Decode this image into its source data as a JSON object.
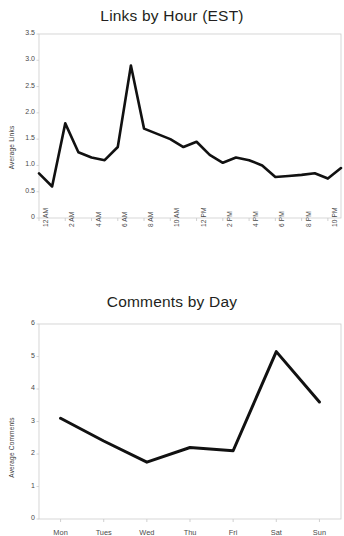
{
  "page": {
    "background_color": "#ffffff",
    "line_color": "#111111",
    "axis_color": "#cccccc",
    "text_color": "#231f20"
  },
  "charts": [
    {
      "id": "links-by-hour",
      "title": "Links by Hour (EST)",
      "ylabel": "Average Links",
      "ytick_labels": [
        "0",
        "0.5",
        "1.0",
        "1.5",
        "2.0",
        "2.5",
        "3.0",
        "3.5"
      ],
      "xtick_labels": [
        "12 AM",
        "2 AM",
        "4 AM",
        "6 AM",
        "8 AM",
        "10 AM",
        "12 PM",
        "2 PM",
        "4 PM",
        "6 PM",
        "8 PM",
        "10 PM"
      ]
    },
    {
      "id": "comments-by-day",
      "title": "Comments by Day",
      "ylabel": "Average Comments",
      "ytick_labels": [
        "0",
        "1",
        "2",
        "3",
        "4",
        "5",
        "6"
      ],
      "xtick_labels": [
        "Mon",
        "Tues",
        "Wed",
        "Thu",
        "Fri",
        "Sat",
        "Sun"
      ]
    }
  ],
  "chart_data": [
    {
      "type": "line",
      "title": "Links by Hour (EST)",
      "xlabel": "",
      "ylabel": "Average Links",
      "ylim": [
        0,
        3.5
      ],
      "ytick_values": [
        0,
        0.5,
        1.0,
        1.5,
        2.0,
        2.5,
        3.0,
        3.5
      ],
      "grid": false,
      "legend": "none",
      "categories": [
        "12 AM",
        "1 AM",
        "2 AM",
        "3 AM",
        "4 AM",
        "5 AM",
        "6 AM",
        "7 AM",
        "8 AM",
        "9 AM",
        "10 AM",
        "11 AM",
        "12 PM",
        "1 PM",
        "2 PM",
        "3 PM",
        "4 PM",
        "5 PM",
        "6 PM",
        "7 PM",
        "8 PM",
        "9 PM",
        "10 PM",
        "11 PM"
      ],
      "xtick_labels": [
        "12 AM",
        "2 AM",
        "4 AM",
        "6 AM",
        "8 AM",
        "10 AM",
        "12 PM",
        "2 PM",
        "4 PM",
        "6 PM",
        "8 PM",
        "10 PM"
      ],
      "values": [
        0.85,
        0.6,
        1.8,
        1.25,
        1.15,
        1.1,
        1.35,
        2.9,
        1.7,
        1.6,
        1.5,
        1.35,
        1.45,
        1.2,
        1.05,
        1.15,
        1.1,
        1.0,
        0.78,
        0.8,
        0.82,
        0.85,
        0.75,
        0.95
      ]
    },
    {
      "type": "line",
      "title": "Comments by Day",
      "xlabel": "",
      "ylabel": "Average Comments",
      "ylim": [
        0,
        6
      ],
      "ytick_values": [
        0,
        1,
        2,
        3,
        4,
        5,
        6
      ],
      "grid": false,
      "legend": "none",
      "categories": [
        "Mon",
        "Tues",
        "Wed",
        "Thu",
        "Fri",
        "Sat",
        "Sun"
      ],
      "values": [
        3.1,
        2.4,
        1.75,
        2.2,
        2.1,
        5.15,
        3.6
      ]
    }
  ]
}
